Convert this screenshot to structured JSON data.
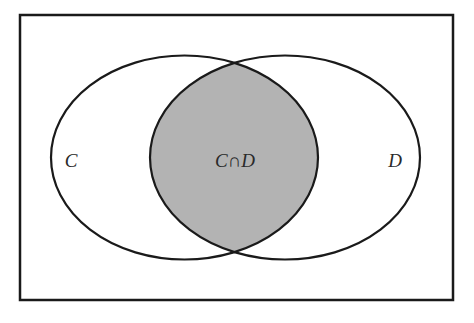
{
  "diagram": {
    "type": "venn",
    "universe": {
      "x": 20,
      "y": 15,
      "width": 433,
      "height": 285,
      "stroke": "#1a1a1a"
    },
    "sets": [
      {
        "id": "C",
        "label": "C",
        "cx": 184.5,
        "cy": 157.5,
        "rx": 133.5,
        "ry": 102,
        "label_x": 71,
        "label_y": 160
      },
      {
        "id": "D",
        "label": "D",
        "cx": 285,
        "cy": 157.5,
        "rx": 135,
        "ry": 102,
        "label_x": 395,
        "label_y": 160
      }
    ],
    "intersection": {
      "label": "C∩D",
      "label_x": 235,
      "label_y": 160,
      "fill": "#b3b3b3",
      "shaded": true
    },
    "colors": {
      "background": "#ffffff",
      "stroke": "#1a1a1a",
      "text": "#2a2a2a",
      "shade": "#b3b3b3"
    }
  }
}
